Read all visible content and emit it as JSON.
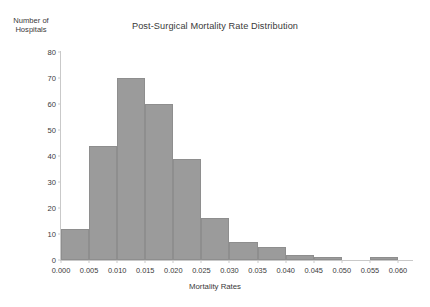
{
  "figure": {
    "clipped_header_artifact": "",
    "background_color": "#ffffff"
  },
  "chart_data": {
    "type": "bar",
    "title": "Post-Surgical Mortality Rate Distribution",
    "xlabel": "Mortality Rates",
    "ylabel": "Number of\nHospitals",
    "ylabel_line1": "Number of",
    "ylabel_line2": "Hospitals",
    "categories": [
      "0.000–0.005",
      "0.005–0.010",
      "0.010–0.015",
      "0.015–0.020",
      "0.020–0.025",
      "0.025–0.030",
      "0.030–0.035",
      "0.035–0.040",
      "0.040–0.045",
      "0.045–0.050",
      "0.050–0.055",
      "0.055–0.060"
    ],
    "bin_edges": [
      0.0,
      0.005,
      0.01,
      0.015,
      0.02,
      0.025,
      0.03,
      0.035,
      0.04,
      0.045,
      0.05,
      0.055,
      0.06
    ],
    "values": [
      12,
      44,
      70,
      60,
      39,
      16,
      7,
      5,
      2,
      1,
      0,
      1
    ],
    "xlim": [
      0.0,
      0.0625
    ],
    "ylim": [
      0,
      80
    ],
    "xticks": [
      0.0,
      0.005,
      0.01,
      0.015,
      0.02,
      0.025,
      0.03,
      0.035,
      0.04,
      0.045,
      0.05,
      0.055,
      0.06
    ],
    "xtick_labels": [
      "0.000",
      "0.005",
      "0.010",
      "0.015",
      "0.020",
      "0.025",
      "0.030",
      "0.035",
      "0.040",
      "0.045",
      "0.050",
      "0.055",
      "0.060"
    ],
    "yticks": [
      0,
      10,
      20,
      30,
      40,
      50,
      60,
      70,
      80
    ],
    "ytick_labels": [
      "0",
      "10",
      "20",
      "30",
      "40",
      "50",
      "60",
      "70",
      "80"
    ],
    "grid": false,
    "legend": null,
    "bar_color": "#9b9b9b",
    "bar_edge_color": "#8e8e8e",
    "axis_color": "#c9c9c9",
    "text_color": "#3a3a3a"
  }
}
